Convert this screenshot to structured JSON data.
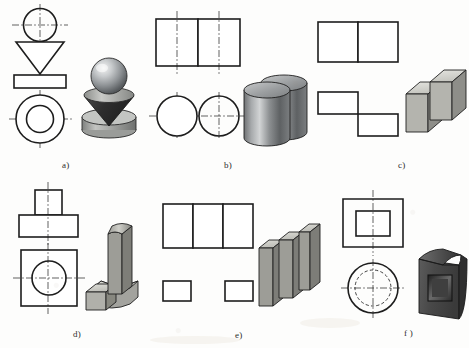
{
  "document": {
    "title": "Orthographic Projection Exercises",
    "kind": "technical-drawing-figure",
    "background_color": "#fdfdfc",
    "line_color": "#1d1d1d",
    "page_width": 469,
    "page_height": 348
  },
  "captions": [
    {
      "id": "a",
      "label": "a)",
      "x": 62,
      "y": 160
    },
    {
      "id": "b",
      "label": "b)",
      "x": 224,
      "y": 160
    },
    {
      "id": "c",
      "label": "c)",
      "x": 398,
      "y": 160
    },
    {
      "id": "d",
      "label": "d)",
      "x": 73,
      "y": 329
    },
    {
      "id": "e",
      "label": "e)",
      "x": 235,
      "y": 330
    },
    {
      "id": "f",
      "label": "f )",
      "x": 404,
      "y": 328
    }
  ],
  "panels": [
    {
      "id": "a",
      "name": "sphere-cone-disc",
      "views": {
        "front": "circle over inverted triangle over rectangle",
        "top": "two concentric circles"
      },
      "solid": "sphere on inverted cone on cylindrical disc",
      "colors": {
        "sphere": "#b9bcbe",
        "cone": "#3a3a3a",
        "disc": "#a9aaa8"
      }
    },
    {
      "id": "b",
      "name": "two-cylinders",
      "views": {
        "front": "two adjacent rectangles",
        "top": "two tangent circles"
      },
      "solid": "two upright cylinders side by side",
      "colors": {
        "body": "#8e9092",
        "top": "#bfc1c2"
      }
    },
    {
      "id": "c",
      "name": "two-offset-blocks",
      "views": {
        "front": "two adjacent squares",
        "top": "two offset rectangles (step)"
      },
      "solid": "two rectangular prisms offset in depth",
      "colors": {
        "top": "#d8d8d2",
        "front": "#b6b6b0",
        "side": "#8d8d88"
      }
    },
    {
      "id": "d",
      "name": "cylinder-on-base",
      "views": {
        "front": "small rectangle on wider rectangle (T shape)",
        "top": "square with centered circle"
      },
      "solid": "vertical slab with rounded top on a stepped base",
      "colors": {
        "top": "#d0d0cb",
        "front": "#a9a9a4",
        "side": "#888884"
      }
    },
    {
      "id": "e",
      "name": "three-plates",
      "views": {
        "front": "three adjacent rectangles",
        "top": "two separated rectangles with gap"
      },
      "solid": "three vertical plates in zigzag arrangement",
      "colors": {
        "top": "#d6d6d0",
        "front": "#9d9d97",
        "side": "#7e7e79"
      }
    },
    {
      "id": "f",
      "name": "hollow-cylinder-square-cavity",
      "views": {
        "front": "hatched square section with rectangular cavity",
        "top": "circle with hidden dashed circle"
      },
      "solid": "dark cylindrical slab with square recess",
      "colors": {
        "body": "#4c4c4c",
        "face": "#5e5e5e",
        "cavity": "#3a3a3a"
      }
    }
  ]
}
